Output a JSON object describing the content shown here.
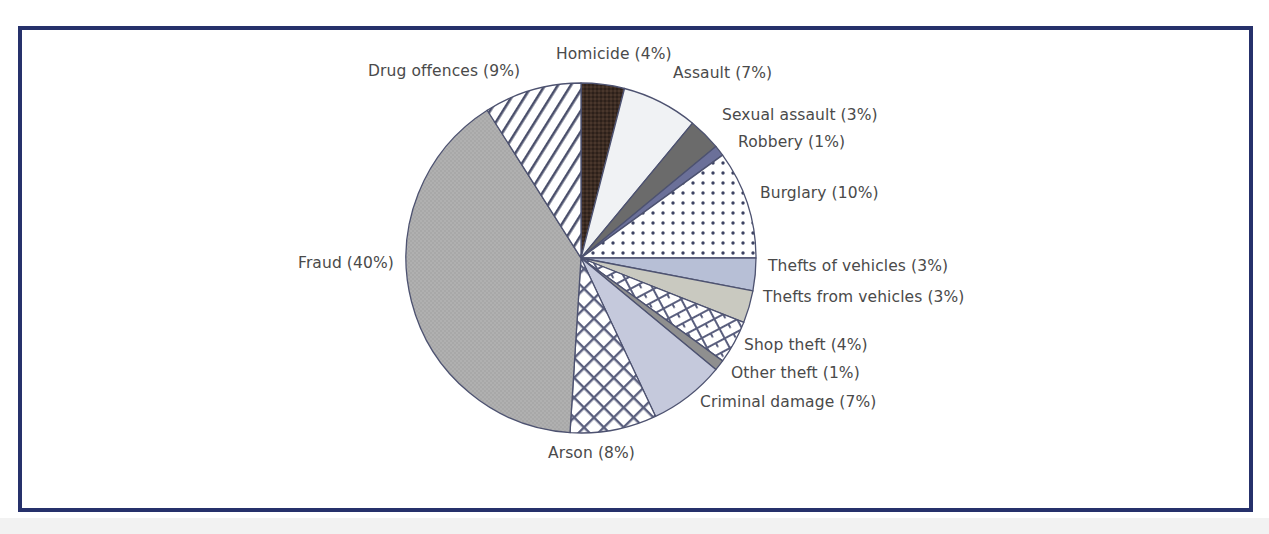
{
  "frame": {
    "border_color": "#26316b",
    "background": "#ffffff"
  },
  "chart_data": {
    "type": "pie",
    "title": "",
    "subtitle": "",
    "xlabel": "",
    "ylabel": "",
    "legend_position": "callout-labels",
    "grid": false,
    "unit": "%",
    "total": 100,
    "start_angle_deg": -90,
    "direction": "clockwise",
    "categories": [
      "Homicide",
      "Assault",
      "Sexual assault",
      "Robbery",
      "Burglary",
      "Thefts of vehicles",
      "Thefts from vehicles",
      "Shop theft",
      "Other theft",
      "Criminal damage",
      "Arson",
      "Fraud",
      "Drug offences"
    ],
    "values": [
      4,
      7,
      3,
      1,
      10,
      3,
      3,
      4,
      1,
      7,
      8,
      40,
      9
    ],
    "labels": [
      "Homicide (4%)",
      "Assault (7%)",
      "Sexual assault (3%)",
      "Robbery (1%)",
      "Burglary (10%)",
      "Thefts of vehicles (3%)",
      "Thefts from vehicles (3%)",
      "Shop theft (4%)",
      "Other theft (1%)",
      "Criminal damage (7%)",
      "Arson (8%)",
      "Fraud (40%)",
      "Drug offences (9%)"
    ],
    "slice_fills": [
      "#3b2b22",
      "#f0f2f4",
      "#6b6b6b",
      "#6b7099",
      "dots",
      "#b7bfd6",
      "#c9c9c0",
      "brick",
      "#8f8f8f",
      "#c5c9dc",
      "lattice",
      "#a8a8a8",
      "stripes"
    ],
    "slice_colors": {
      "Homicide": "#3b2b22",
      "Assault": "#f0f2f4",
      "Sexual assault": "#6b6b6b",
      "Robbery": "#6b7099",
      "Burglary": "#ffffff",
      "Thefts of vehicles": "#b7bfd6",
      "Thefts from vehicles": "#c9c9c0",
      "Shop theft": "#ffffff",
      "Other theft": "#8f8f8f",
      "Criminal damage": "#c5c9dc",
      "Arson": "#ffffff",
      "Fraud": "#a8a8a8",
      "Drug offences": "#ffffff"
    },
    "outline_color": "#4d5270"
  },
  "callouts": [
    {
      "name": "homicide",
      "text": "Homicide (4%)",
      "left": 556,
      "top": 45,
      "align": "left"
    },
    {
      "name": "drug-offences",
      "text": "Drug offences (9%)",
      "left": 368,
      "top": 62,
      "align": "left"
    },
    {
      "name": "assault",
      "text": "Assault (7%)",
      "left": 673,
      "top": 64,
      "align": "left"
    },
    {
      "name": "sexual-assault",
      "text": "Sexual assault (3%)",
      "left": 722,
      "top": 106,
      "align": "left"
    },
    {
      "name": "robbery",
      "text": "Robbery (1%)",
      "left": 738,
      "top": 133,
      "align": "left"
    },
    {
      "name": "burglary",
      "text": "Burglary (10%)",
      "left": 760,
      "top": 184,
      "align": "left"
    },
    {
      "name": "thefts-of-vehicles",
      "text": "Thefts of vehicles (3%)",
      "left": 768,
      "top": 257,
      "align": "left"
    },
    {
      "name": "thefts-from-vehicles",
      "text": "Thefts from vehicles (3%)",
      "left": 763,
      "top": 288,
      "align": "left"
    },
    {
      "name": "shop-theft",
      "text": "Shop theft (4%)",
      "left": 744,
      "top": 336,
      "align": "left"
    },
    {
      "name": "other-theft",
      "text": "Other theft (1%)",
      "left": 731,
      "top": 364,
      "align": "left"
    },
    {
      "name": "criminal-damage",
      "text": "Criminal damage (7%)",
      "left": 700,
      "top": 393,
      "align": "left"
    },
    {
      "name": "arson",
      "text": "Arson (8%)",
      "left": 548,
      "top": 444,
      "align": "left"
    },
    {
      "name": "fraud",
      "text": "Fraud (40%)",
      "left": 298,
      "top": 254,
      "align": "left"
    }
  ],
  "geometry": {
    "center_x": 581,
    "center_y": 258,
    "radius": 175
  }
}
